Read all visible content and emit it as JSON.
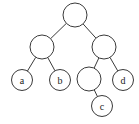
{
  "diagram": {
    "type": "binary-tree",
    "colors": {
      "stroke": "#3a3a3a",
      "fill": "#ffffff",
      "text": "#222222",
      "background": "#ffffff"
    },
    "nodes": [
      {
        "id": "root",
        "label": "",
        "cx": 75,
        "cy": 15,
        "r": 12
      },
      {
        "id": "left",
        "label": "",
        "cx": 42,
        "cy": 47,
        "r": 12
      },
      {
        "id": "right",
        "label": "",
        "cx": 104,
        "cy": 47,
        "r": 12
      },
      {
        "id": "a",
        "label": "a",
        "cx": 22,
        "cy": 80,
        "r": 10.5
      },
      {
        "id": "b",
        "label": "b",
        "cx": 60,
        "cy": 80,
        "r": 10.5
      },
      {
        "id": "right-left",
        "label": "",
        "cx": 89,
        "cy": 79,
        "r": 12
      },
      {
        "id": "d",
        "label": "d",
        "cx": 123,
        "cy": 80,
        "r": 10.5
      },
      {
        "id": "c",
        "label": "c",
        "cx": 102,
        "cy": 106,
        "r": 10.5
      }
    ],
    "edges": [
      {
        "from": "root",
        "to": "left"
      },
      {
        "from": "root",
        "to": "right"
      },
      {
        "from": "left",
        "to": "a"
      },
      {
        "from": "left",
        "to": "b"
      },
      {
        "from": "right",
        "to": "right-left"
      },
      {
        "from": "right",
        "to": "d"
      },
      {
        "from": "right-left",
        "to": "c"
      }
    ]
  }
}
